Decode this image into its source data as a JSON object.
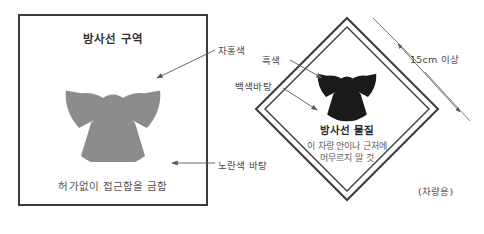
{
  "diagram": {
    "title_semantic": "radiation-warning-signage-diagram",
    "colors": {
      "trefoil_area_sign": "#8c8c8c",
      "trefoil_placard": "#1a1a1a",
      "sign_border": "#3b3b3b",
      "placard_border": "#3b3b3b",
      "sign_background": "#ffffff",
      "placard_background": "#ffffff",
      "text": "#4a4a4a",
      "leader_line": "#5a5a5a"
    }
  },
  "area_sign": {
    "name": "radiation-area-sign",
    "title": "방사선 구역",
    "footer": "허가없이 접근함을 금함",
    "trefoil_icon": "radiation-trefoil-icon"
  },
  "placard": {
    "name": "radioactive-material-placard",
    "title": "방사선 물질",
    "sub_line1": "이 차량 안이나 근처에",
    "sub_line2": "머무르지 말 것",
    "trefoil_icon": "radiation-trefoil-icon"
  },
  "callouts": {
    "magenta": "자홍색",
    "yellow_background": "노란색 바탕",
    "black": "흑색",
    "white_background": "백색바탕",
    "size": "15cm 이상",
    "vehicle_use": "(차량용)"
  }
}
